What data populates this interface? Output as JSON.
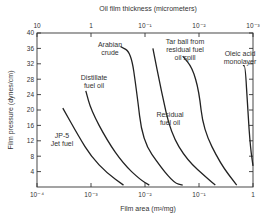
{
  "chart_data": {
    "type": "line",
    "title": "",
    "xlabel": "Film area (m²/mg)",
    "x2label": "Oil film thickness (micrometers)",
    "ylabel": "Film pressure (dynes/cm)",
    "xscale": "log",
    "xlim": [
      0.0001,
      1
    ],
    "ylim": [
      0,
      40
    ],
    "x_ticks": [
      "10⁻⁴",
      "10⁻³",
      "10⁻²",
      "10⁻¹",
      "1"
    ],
    "x2_ticks": [
      "10",
      "1",
      "10⁻¹",
      "10⁻²",
      "10⁻³"
    ],
    "y_ticks": [
      "4",
      "8",
      "12",
      "16",
      "20",
      "24",
      "28",
      "32",
      "36",
      "40"
    ],
    "grid": false,
    "series": [
      {
        "name": "JP-5 Jet fuel",
        "label_lines": [
          "JP-5",
          "Jet fuel"
        ],
        "points": [
          [
            0.0003,
            20.5
          ],
          [
            0.0006,
            13
          ],
          [
            0.001,
            8
          ],
          [
            0.002,
            3.5
          ],
          [
            0.004,
            0.5
          ]
        ]
      },
      {
        "name": "Distillate fuel oil",
        "label_lines": [
          "Distillate",
          "fuel oil"
        ],
        "points": [
          [
            0.0008,
            25
          ],
          [
            0.001,
            20
          ],
          [
            0.002,
            12
          ],
          [
            0.004,
            6
          ],
          [
            0.008,
            2
          ],
          [
            0.012,
            0.5
          ]
        ]
      },
      {
        "name": "Arabian crude",
        "label_lines": [
          "Arabian",
          "crude"
        ],
        "points": [
          [
            0.0035,
            36.5
          ],
          [
            0.0055,
            35
          ],
          [
            0.007,
            25
          ],
          [
            0.009,
            12
          ],
          [
            0.02,
            5
          ],
          [
            0.035,
            1
          ],
          [
            0.05,
            0.5
          ]
        ]
      },
      {
        "name": "Residual fuel oil",
        "label_lines": [
          "Residual",
          "fuel oil"
        ],
        "points": [
          [
            0.014,
            36
          ],
          [
            0.02,
            25
          ],
          [
            0.03,
            14
          ],
          [
            0.06,
            7
          ],
          [
            0.15,
            2
          ],
          [
            0.2,
            0.5
          ]
        ]
      },
      {
        "name": "Tar ball from residual fuel oil spill",
        "label_lines": [
          "Tar ball from",
          "residual fuel",
          "oil spill"
        ],
        "points": [
          [
            0.05,
            34
          ],
          [
            0.075,
            31
          ],
          [
            0.1,
            25
          ],
          [
            0.12,
            15
          ],
          [
            0.25,
            6
          ],
          [
            0.5,
            0.5
          ]
        ]
      },
      {
        "name": "Oleic acid monolayer",
        "label_lines": [
          "Oleic acid",
          "monolayer"
        ],
        "points": [
          [
            0.65,
            31.5
          ],
          [
            0.72,
            31.5
          ],
          [
            0.8,
            20
          ],
          [
            0.9,
            10
          ],
          [
            1.0,
            5.5
          ]
        ]
      }
    ]
  },
  "labels": {
    "top_axis_title": "Oil film thickness (micrometers)",
    "bottom_axis_title": "Film area (m²/mg)",
    "y_axis_title": "Film pressure (dynes/cm)"
  }
}
